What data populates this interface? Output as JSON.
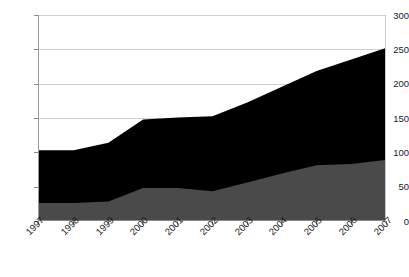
{
  "chart_data": {
    "type": "area",
    "title": "",
    "xlabel": "",
    "ylabel": "",
    "x": [
      "1997",
      "1998",
      "1999",
      "2000",
      "2001",
      "2002",
      "2003",
      "2004",
      "2005",
      "2006",
      "2007"
    ],
    "categories": [
      "1997",
      "1998",
      "1999",
      "2000",
      "2001",
      "2002",
      "2003",
      "2004",
      "2005",
      "2006",
      "2007"
    ],
    "ylim": [
      0,
      300
    ],
    "xlim": [
      "1997",
      "2007"
    ],
    "y_ticks": [
      0,
      50,
      100,
      150,
      200,
      250,
      300
    ],
    "y_tick_labels": [
      "0",
      "50",
      "100",
      "150",
      "200",
      "250",
      "300"
    ],
    "grid": true,
    "legend": "none",
    "stacked": true,
    "series": [
      {
        "name": "lower-series",
        "color": "#4a4a4a",
        "values": [
          25,
          25,
          27,
          47,
          47,
          42,
          55,
          68,
          80,
          82,
          88
        ]
      },
      {
        "name": "upper-series",
        "color": "#000000",
        "values": [
          77,
          77,
          86,
          100,
          103,
          110,
          117,
          127,
          138,
          153,
          164
        ]
      }
    ],
    "cumulative_totals": [
      102,
      102,
      113,
      147,
      150,
      152,
      172,
      195,
      218,
      235,
      252
    ],
    "annotations": []
  },
  "style": {
    "plot_background": "#ffffff",
    "gridline_color": "#cfcfcf",
    "axis_color": "#8a8a8a",
    "tick_label_color": "#1a1a1a"
  }
}
